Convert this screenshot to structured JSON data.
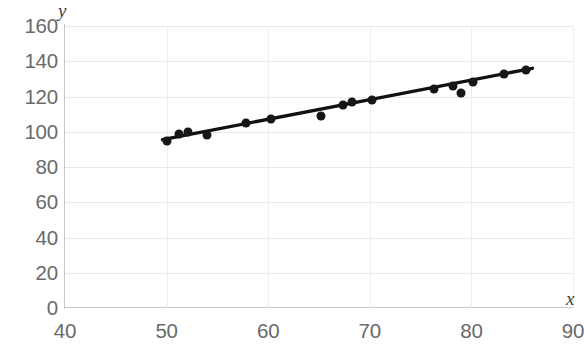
{
  "chart_data": {
    "type": "scatter",
    "title": "",
    "subtitle": "",
    "xlabel": "x",
    "ylabel": "y",
    "xlim": [
      40,
      90
    ],
    "ylim": [
      0,
      160
    ],
    "xticks": [
      40,
      50,
      60,
      70,
      80,
      90
    ],
    "yticks": [
      0,
      20,
      40,
      60,
      80,
      100,
      120,
      140,
      160
    ],
    "grid": true,
    "legend": null,
    "series": [
      {
        "name": "observations",
        "marker": "filled-circle",
        "color": "#161616",
        "points": [
          {
            "x": 50.0,
            "y": 95
          },
          {
            "x": 51.2,
            "y": 99
          },
          {
            "x": 52.1,
            "y": 100
          },
          {
            "x": 54.0,
            "y": 98
          },
          {
            "x": 57.8,
            "y": 105
          },
          {
            "x": 60.3,
            "y": 107
          },
          {
            "x": 65.2,
            "y": 109
          },
          {
            "x": 67.4,
            "y": 115
          },
          {
            "x": 68.2,
            "y": 117
          },
          {
            "x": 70.2,
            "y": 118
          },
          {
            "x": 76.3,
            "y": 124
          },
          {
            "x": 78.2,
            "y": 126
          },
          {
            "x": 79.0,
            "y": 122
          },
          {
            "x": 80.2,
            "y": 128
          },
          {
            "x": 83.2,
            "y": 133
          },
          {
            "x": 85.4,
            "y": 135
          }
        ]
      }
    ],
    "trendline": {
      "name": "linear-fit",
      "color": "#111111",
      "x_start": 49.6,
      "y_start": 95.5,
      "x_end": 86.0,
      "y_end": 136.0
    },
    "colors": {
      "marker": "#161616",
      "trendline": "#111111",
      "grid": "#e9e9ec",
      "axis": "#c9c9cd",
      "tick_label": "#6a6a6a",
      "axis_label": "#3f3f3f",
      "background": "#ffffff"
    }
  }
}
